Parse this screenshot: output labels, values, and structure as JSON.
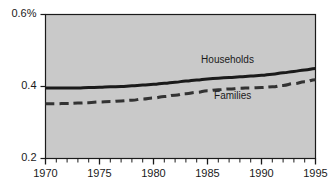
{
  "chart_data": {
    "type": "line",
    "title": "",
    "subtitle": "",
    "xlabel": "",
    "ylabel": "",
    "xlim": [
      1970,
      1995
    ],
    "ylim": [
      0.2,
      0.6
    ],
    "grid": false,
    "legend_position": "inline-annotation",
    "plot_background": "#c9c9c9",
    "x_ticks_major": [
      "1970",
      "1975",
      "1980",
      "1985",
      "1990",
      "1995"
    ],
    "x_tick_values": [
      1970,
      1975,
      1980,
      1985,
      1990,
      1995
    ],
    "x_minor_tick_interval": 1,
    "y_ticks": [
      "0.2",
      "0.4",
      "0.6%"
    ],
    "y_tick_values": [
      0.2,
      0.4,
      0.6
    ],
    "x": [
      1970,
      1971,
      1972,
      1973,
      1974,
      1975,
      1976,
      1977,
      1978,
      1979,
      1980,
      1981,
      1982,
      1983,
      1984,
      1985,
      1986,
      1987,
      1988,
      1989,
      1990,
      1991,
      1992,
      1993,
      1994,
      1995
    ],
    "series": [
      {
        "name": "Households",
        "label": "Households",
        "style": "solid",
        "color": "#1a1a1a",
        "width": 3,
        "values": [
          0.396,
          0.396,
          0.396,
          0.396,
          0.397,
          0.398,
          0.399,
          0.4,
          0.402,
          0.404,
          0.406,
          0.409,
          0.412,
          0.415,
          0.418,
          0.421,
          0.423,
          0.425,
          0.427,
          0.429,
          0.431,
          0.434,
          0.438,
          0.442,
          0.446,
          0.45
        ]
      },
      {
        "name": "Families",
        "label": "Families",
        "style": "dashed",
        "color": "#333333",
        "width": 3,
        "values": [
          0.352,
          0.352,
          0.353,
          0.354,
          0.355,
          0.357,
          0.358,
          0.36,
          0.362,
          0.365,
          0.368,
          0.372,
          0.376,
          0.38,
          0.384,
          0.388,
          0.391,
          0.393,
          0.395,
          0.396,
          0.397,
          0.399,
          0.403,
          0.408,
          0.413,
          0.419
        ]
      }
    ],
    "annotations": [
      {
        "text": "Households",
        "x": 1987.0,
        "y": 0.472
      },
      {
        "text": "Families",
        "x": 1988.2,
        "y": 0.372
      }
    ]
  }
}
